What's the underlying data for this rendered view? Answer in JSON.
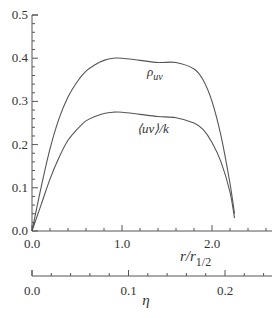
{
  "chart_data": {
    "type": "line",
    "title": "",
    "xlabel": "r/r_1/2",
    "xlabel_main": "r/r",
    "xlabel_sub": "1/2",
    "x2label": "η",
    "ylabel": "",
    "xlim": [
      0,
      2.45
    ],
    "ylim": [
      0,
      0.5
    ],
    "x2lim": [
      0,
      0.24
    ],
    "x_ticks": [
      "0.0",
      "1.0",
      "2.0"
    ],
    "y_ticks": [
      "0.0",
      "0.1",
      "0.2",
      "0.3",
      "0.4",
      "0.5"
    ],
    "x2_ticks": [
      "0.0",
      "0.1",
      "0.2"
    ],
    "grid": false,
    "series": [
      {
        "name": "ρ_uv",
        "label_main": "ρ",
        "label_sub": "uv",
        "x": [
          0.0,
          0.1,
          0.2,
          0.3,
          0.4,
          0.5,
          0.6,
          0.7,
          0.8,
          0.9,
          1.0,
          1.2,
          1.4,
          1.6,
          1.8,
          1.9,
          2.0,
          2.1,
          2.2,
          2.25
        ],
        "values": [
          0.0,
          0.1,
          0.19,
          0.26,
          0.31,
          0.345,
          0.37,
          0.385,
          0.395,
          0.4,
          0.4,
          0.395,
          0.39,
          0.39,
          0.375,
          0.35,
          0.3,
          0.22,
          0.11,
          0.04
        ]
      },
      {
        "name": "⟨uv⟩/k",
        "label": "⟨uv⟩/k",
        "x": [
          0.0,
          0.1,
          0.2,
          0.3,
          0.4,
          0.5,
          0.6,
          0.7,
          0.8,
          0.9,
          1.0,
          1.2,
          1.4,
          1.6,
          1.8,
          1.9,
          2.0,
          2.1,
          2.2,
          2.25
        ],
        "values": [
          0.0,
          0.06,
          0.12,
          0.17,
          0.21,
          0.235,
          0.255,
          0.265,
          0.272,
          0.275,
          0.275,
          0.27,
          0.265,
          0.262,
          0.25,
          0.235,
          0.205,
          0.16,
          0.09,
          0.03
        ]
      }
    ]
  }
}
